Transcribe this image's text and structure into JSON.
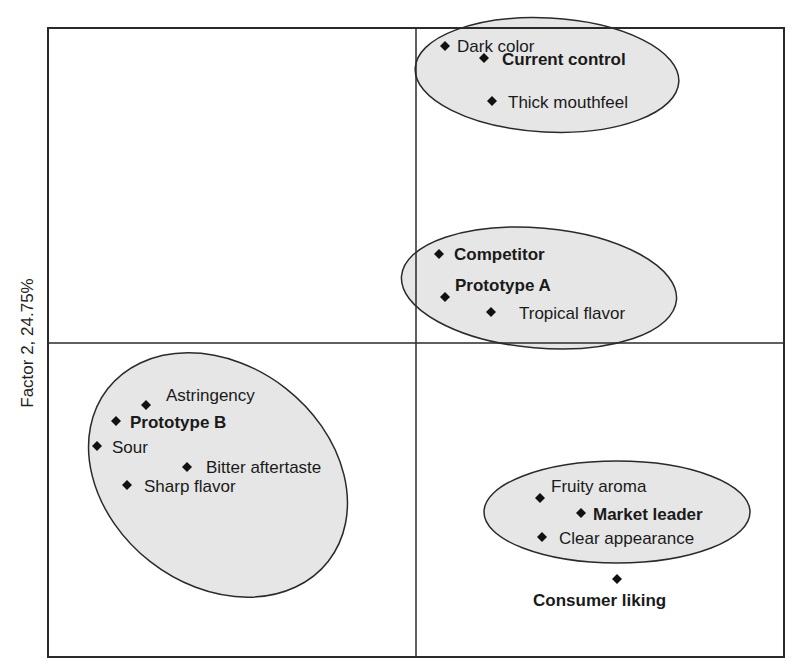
{
  "chart_data": {
    "type": "scatter",
    "title": "",
    "xlabel": "",
    "ylabel": "Factor 2, 24.75%",
    "grid": false,
    "axes_cross_at_origin": true,
    "plot_area_px": {
      "left": 48,
      "top": 28,
      "right": 784,
      "bottom": 657,
      "origin_x": 416,
      "origin_y": 343
    },
    "legend": null,
    "clusters": [
      {
        "name": "cluster-top",
        "cx": 547,
        "cy": 75,
        "rx": 132,
        "ry": 57,
        "rotate": 3,
        "members": [
          "Dark color",
          "Current control",
          "Thick mouthfeel"
        ]
      },
      {
        "name": "cluster-middle",
        "cx": 539,
        "cy": 288,
        "rx": 138,
        "ry": 60,
        "rotate": 5,
        "members": [
          "Competitor",
          "Prototype A",
          "Tropical flavor"
        ]
      },
      {
        "name": "cluster-left",
        "cx": 218,
        "cy": 475,
        "rx": 140,
        "ry": 110,
        "rotate": 38,
        "members": [
          "Astringency",
          "Prototype B",
          "Sour",
          "Bitter aftertaste",
          "Sharp flavor"
        ]
      },
      {
        "name": "cluster-bottom-right",
        "cx": 617,
        "cy": 512,
        "rx": 133,
        "ry": 51,
        "rotate": 0,
        "members": [
          "Fruity aroma",
          "Market leader",
          "Clear appearance"
        ]
      }
    ],
    "points": [
      {
        "label": "Dark color",
        "x": 445,
        "y": 46,
        "bold": false,
        "label_dx": 12,
        "label_dy": 6
      },
      {
        "label": "Current control",
        "x": 484,
        "y": 58,
        "bold": true,
        "label_dx": 18,
        "label_dy": 7
      },
      {
        "label": "Thick mouthfeel",
        "x": 492,
        "y": 101,
        "bold": false,
        "label_dx": 16,
        "label_dy": 7
      },
      {
        "label": "Competitor",
        "x": 439,
        "y": 254,
        "bold": true,
        "label_dx": 15,
        "label_dy": 6
      },
      {
        "label": "Prototype A",
        "x": 445,
        "y": 297,
        "bold": true,
        "label_dx": 10,
        "label_dy": -6
      },
      {
        "label": "Tropical flavor",
        "x": 491,
        "y": 312,
        "bold": false,
        "label_dx": 28,
        "label_dy": 7
      },
      {
        "label": "Astringency",
        "x": 146,
        "y": 405,
        "bold": false,
        "label_dx": 20,
        "label_dy": -4
      },
      {
        "label": "Prototype B",
        "x": 116,
        "y": 421,
        "bold": true,
        "label_dx": 14,
        "label_dy": 7
      },
      {
        "label": "Sour",
        "x": 97,
        "y": 446,
        "bold": false,
        "label_dx": 15,
        "label_dy": 7
      },
      {
        "label": "Bitter aftertaste",
        "x": 187,
        "y": 467,
        "bold": false,
        "label_dx": 19,
        "label_dy": 6
      },
      {
        "label": "Sharp flavor",
        "x": 127,
        "y": 485,
        "bold": false,
        "label_dx": 17,
        "label_dy": 7
      },
      {
        "label": "Fruity aroma",
        "x": 540,
        "y": 498,
        "bold": false,
        "label_dx": 11,
        "label_dy": -6
      },
      {
        "label": "Market leader",
        "x": 581,
        "y": 513,
        "bold": true,
        "label_dx": 12,
        "label_dy": 7
      },
      {
        "label": "Clear appearance",
        "x": 542,
        "y": 537,
        "bold": false,
        "label_dx": 17,
        "label_dy": 7
      },
      {
        "label": "Consumer liking",
        "x": 617,
        "y": 579,
        "bold": true,
        "label_dx": -84,
        "label_dy": 27
      }
    ],
    "colors": {
      "frame": "#2a2a2a",
      "ellipse_fill": "#e6e6e6",
      "ellipse_stroke": "#2a2a2a",
      "marker": "#111111",
      "text": "#1a1a1a"
    }
  }
}
